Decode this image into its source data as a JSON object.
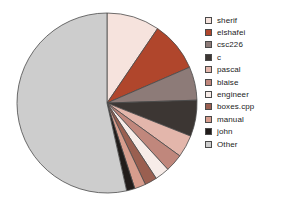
{
  "chart_data": {
    "type": "pie",
    "title": "",
    "subtitle": "",
    "xlabel": "",
    "ylabel": "",
    "grid": false,
    "legend_position": "right",
    "start_angle_deg": 0,
    "direction": "clockwise",
    "categories": [
      "sherif",
      "elshafei",
      "csc226",
      "c",
      "pascal",
      "blaise",
      "engineer",
      "boxes.cpp",
      "manual",
      "john",
      "Other"
    ],
    "values": [
      9.5,
      9.0,
      6.0,
      6.5,
      4.0,
      3.2,
      2.6,
      2.2,
      2.0,
      1.5,
      53.5
    ],
    "unit": "percent",
    "colors": [
      "#f6e3dd",
      "#b0462c",
      "#8d7b78",
      "#3c3633",
      "#e3b6ab",
      "#c0877c",
      "#f7ece8",
      "#9a5f50",
      "#d79d8d",
      "#211c1a",
      "#cdcdcd"
    ],
    "slice_edge_color": "#4a4a4a",
    "labels_shown": false
  },
  "legend": {
    "items": [
      {
        "label": "sherif",
        "color": "#f6e3dd"
      },
      {
        "label": "elshafei",
        "color": "#b0462c"
      },
      {
        "label": "csc226",
        "color": "#8d7b78"
      },
      {
        "label": "c",
        "color": "#3c3633"
      },
      {
        "label": "pascal",
        "color": "#e3b6ab"
      },
      {
        "label": "blaise",
        "color": "#c0877c"
      },
      {
        "label": "engineer",
        "color": "#f7ece8"
      },
      {
        "label": "boxes.cpp",
        "color": "#9a5f50"
      },
      {
        "label": "manual",
        "color": "#d79d8d"
      },
      {
        "label": "john",
        "color": "#211c1a"
      },
      {
        "label": "Other",
        "color": "#cdcdcd"
      }
    ]
  }
}
